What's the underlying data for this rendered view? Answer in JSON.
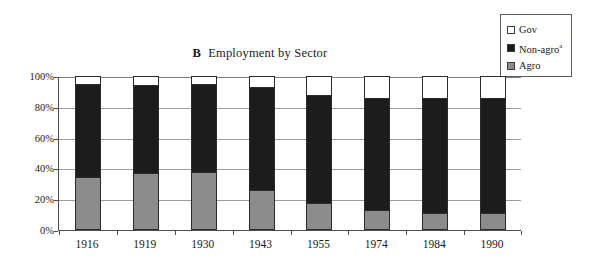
{
  "chart_data": {
    "type": "bar",
    "subtype": "stacked-100-percent",
    "title": "Employment by Sector",
    "panel_letter": "B",
    "xlabel": "",
    "ylabel": "",
    "ylim": [
      0,
      100
    ],
    "ytick_labels": [
      "0%",
      "20%",
      "40%",
      "60%",
      "80%",
      "100%"
    ],
    "ytick_values": [
      0,
      20,
      40,
      60,
      80,
      100
    ],
    "grid": true,
    "legend_position": "top-right",
    "categories": [
      "1916",
      "1919",
      "1930",
      "1943",
      "1955",
      "1974",
      "1984",
      "1990"
    ],
    "series": [
      {
        "name": "Agro",
        "label": "Agro",
        "color": "#8c8c8c",
        "values": [
          34.5,
          37,
          37.5,
          26,
          17.5,
          13,
          11,
          11
        ]
      },
      {
        "name": "Non-agro",
        "label": "Non-agro",
        "label_superscript": "a",
        "color": "#1c1c1c",
        "values": [
          60.5,
          57,
          57,
          67,
          70.5,
          73,
          74.5,
          74.5
        ]
      },
      {
        "name": "Gov",
        "label": "Gov",
        "color": "#ffffff",
        "values": [
          5,
          6,
          5.5,
          7,
          12,
          14,
          14.5,
          14.5
        ]
      }
    ],
    "stack_order_bottom_to_top": [
      "Agro",
      "Non-agro",
      "Gov"
    ]
  },
  "legend": {
    "items": [
      {
        "label": "Gov",
        "sup": "",
        "color": "#ffffff"
      },
      {
        "label": "Non-agro",
        "sup": "a",
        "color": "#1c1c1c"
      },
      {
        "label": "Agro",
        "sup": "",
        "color": "#8c8c8c"
      }
    ]
  },
  "colors": {
    "agro": "#8c8c8c",
    "non_agro": "#1c1c1c",
    "gov": "#ffffff",
    "axis": "#4d4d4d",
    "grid": "#9b9b9b",
    "background": "#ffffff"
  }
}
